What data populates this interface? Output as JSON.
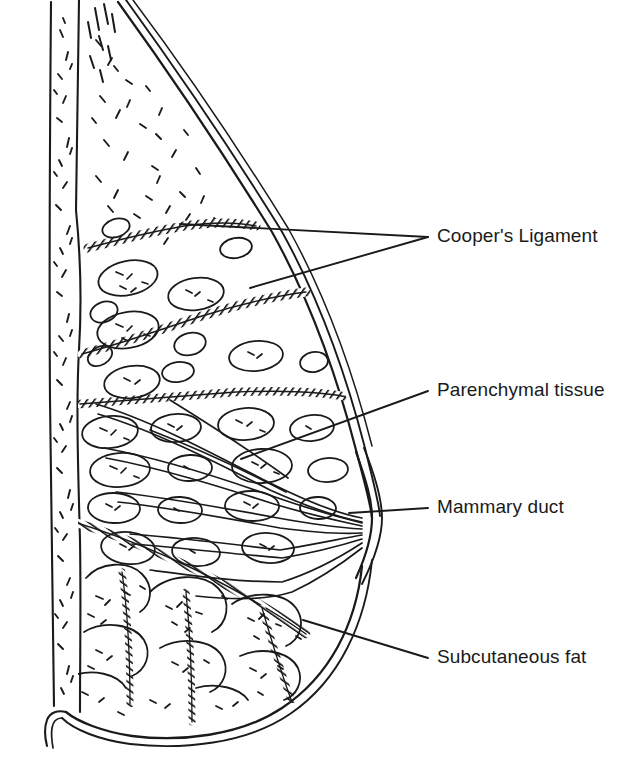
{
  "figure": {
    "view": "sagittal section, nipple facing right",
    "style": "black ink line art on white background",
    "colors": {
      "ink": "#1a1a1a",
      "background": "#ffffff",
      "hatch": "#000000"
    }
  },
  "labels": [
    {
      "id": "coopers",
      "text": "Cooper's Ligament",
      "anchor_x": 437,
      "anchor_y": 226,
      "leader_count": 2,
      "leader_targets": [
        [
          180,
          224
        ],
        [
          250,
          288
        ]
      ],
      "structure": "suspensory ligaments, drawn as thick cross-hatched bands"
    },
    {
      "id": "parenchymal",
      "text": "Parenchymal tissue",
      "anchor_x": 437,
      "anchor_y": 380,
      "leader_count": 1,
      "leader_targets": [
        [
          241,
          459
        ]
      ],
      "structure": "glandular lobules, drawn as stippled ovals"
    },
    {
      "id": "mammary",
      "text": "Mammary duct",
      "anchor_x": 437,
      "anchor_y": 497,
      "leader_count": 1,
      "leader_targets": [
        [
          349,
          513
        ]
      ],
      "structure": "paired thin lines converging at the nipple"
    },
    {
      "id": "subcutaneous",
      "text": "Subcutaneous fat",
      "anchor_x": 437,
      "anchor_y": 647,
      "leader_count": 1,
      "leader_targets": [
        [
          303,
          620
        ]
      ],
      "structure": "large rounded stippled fat lobules beneath the skin"
    }
  ],
  "anatomy": {
    "chest_wall": "vertical stippled band at far left",
    "skin": "double contour line from top-left curving to nipple at right",
    "nipple": {
      "x": 372,
      "y": 520
    },
    "inframammary_fold": "curved lower border with small hook at lower-left"
  }
}
